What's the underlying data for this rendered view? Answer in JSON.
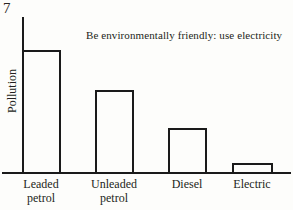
{
  "figure": {
    "number": "7",
    "caption": "Be environmentally friendly: use electricity"
  },
  "axes": {
    "ylabel": "Pollution",
    "xlabel": ""
  },
  "chart_data": {
    "type": "bar",
    "title": "",
    "subtitle": "",
    "annotations": [
      "Be environmentally friendly: use electricity"
    ],
    "categories": [
      "Leaded petrol",
      "Unleaded petrol",
      "Diesel",
      "Electric"
    ],
    "category_lines": [
      [
        "Leaded",
        "petrol"
      ],
      [
        "Unleaded",
        "petrol"
      ],
      [
        "Diesel",
        ""
      ],
      [
        "Electric",
        ""
      ]
    ],
    "values": [
      123,
      83,
      45,
      10
    ],
    "values_normalized": [
      1.0,
      0.67,
      0.37,
      0.08
    ],
    "series": [
      {
        "name": "Pollution",
        "values": [
          123,
          83,
          45,
          10
        ]
      }
    ],
    "xlabel": "",
    "ylabel": "Pollution",
    "ylim": [
      0,
      157
    ],
    "yticks": [],
    "ytick_labels": [],
    "grid": false,
    "legend": false,
    "legend_position": "none",
    "bar_style": "outline",
    "bar_fill": "none",
    "bar_edge_color": "#1a1a1a",
    "axis_color": "#1a1a1a",
    "background_color": "#fdfdfb",
    "text_color": "#231f20"
  },
  "bars": [
    {
      "label": "Leaded petrol",
      "line1": "Leaded",
      "line2": "petrol",
      "left": 22,
      "width": 39,
      "top": 50,
      "height": 124,
      "center": 41
    },
    {
      "label": "Unleaded petrol",
      "line1": "Unleaded",
      "line2": "petrol",
      "left": 95,
      "width": 39,
      "top": 90,
      "height": 84,
      "center": 114
    },
    {
      "label": "Diesel",
      "line1": "Diesel",
      "line2": "",
      "left": 168,
      "width": 39,
      "top": 128,
      "height": 46,
      "center": 187
    },
    {
      "label": "Electric",
      "line1": "Electric",
      "line2": "",
      "left": 232,
      "width": 41,
      "top": 163,
      "height": 11,
      "center": 252
    }
  ]
}
